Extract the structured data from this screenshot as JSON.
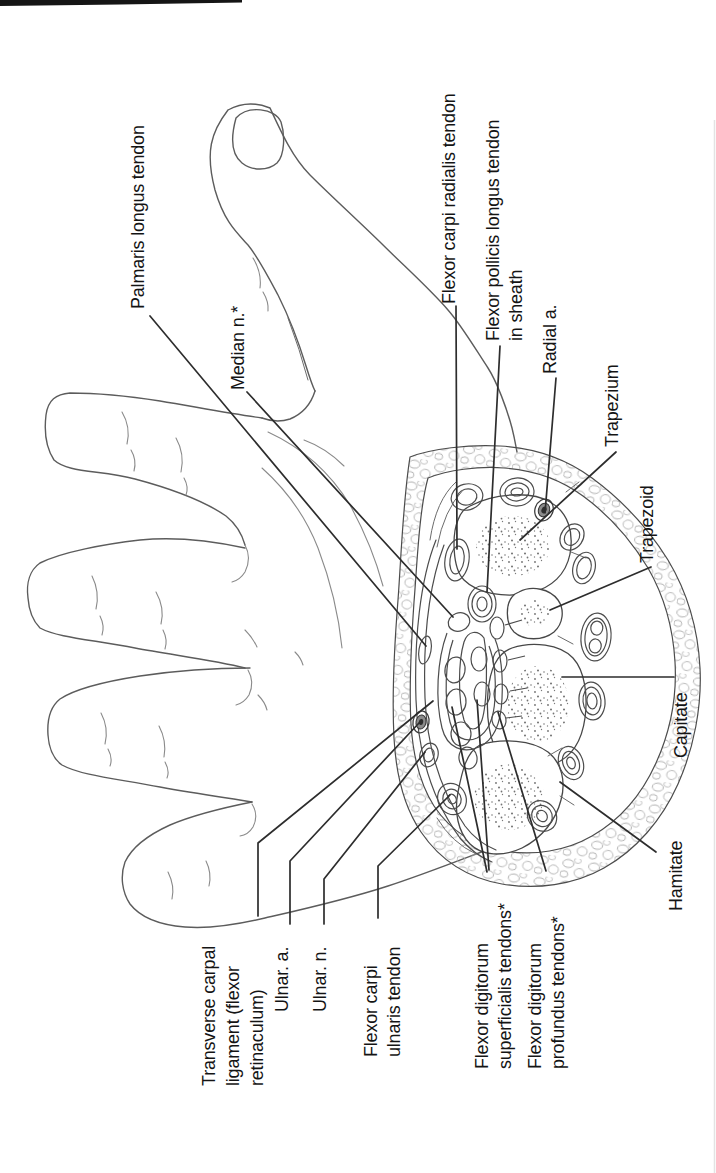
{
  "figure": {
    "type": "anatomical line illustration",
    "text_color": "#141414",
    "line_color": "#5c5c5c",
    "background": "#ffffff"
  },
  "labels": [
    {
      "id": "palmaris-longus-tendon",
      "lines": [
        "Palmaris longus tendon"
      ]
    },
    {
      "id": "median-nerve",
      "lines": [
        "Median n.*"
      ]
    },
    {
      "id": "flexor-carpi-radialis-tendon",
      "lines": [
        "Flexor carpi radialis tendon"
      ]
    },
    {
      "id": "flexor-pollicis-longus-tendon",
      "lines": [
        "Flexor pollicis longus tendon",
        "in sheath"
      ]
    },
    {
      "id": "radial-artery",
      "lines": [
        "Radial a."
      ]
    },
    {
      "id": "trapezium",
      "lines": [
        "Trapezium"
      ]
    },
    {
      "id": "trapezoid",
      "lines": [
        "Trapezoid"
      ]
    },
    {
      "id": "capitate",
      "lines": [
        "Capitate"
      ]
    },
    {
      "id": "hamate",
      "lines": [
        "Hamitate"
      ]
    },
    {
      "id": "transverse-carpal-ligament",
      "lines": [
        "Transverse carpal",
        "ligament (flexor",
        "retinaculum)"
      ]
    },
    {
      "id": "ulnar-artery",
      "lines": [
        "Ulnar. a."
      ]
    },
    {
      "id": "ulnar-nerve",
      "lines": [
        "Ulnar. n."
      ]
    },
    {
      "id": "flexor-carpi-ulnaris-tendon",
      "lines": [
        "Flexor carpi",
        "ulnaris tendon"
      ]
    },
    {
      "id": "flexor-digitorum-superficialis",
      "lines": [
        "Flexor digitorum",
        "superficialis tendons*"
      ]
    },
    {
      "id": "flexor-digitorum-profundus",
      "lines": [
        "Flexor digitorum",
        "profundus tendons*"
      ]
    }
  ]
}
